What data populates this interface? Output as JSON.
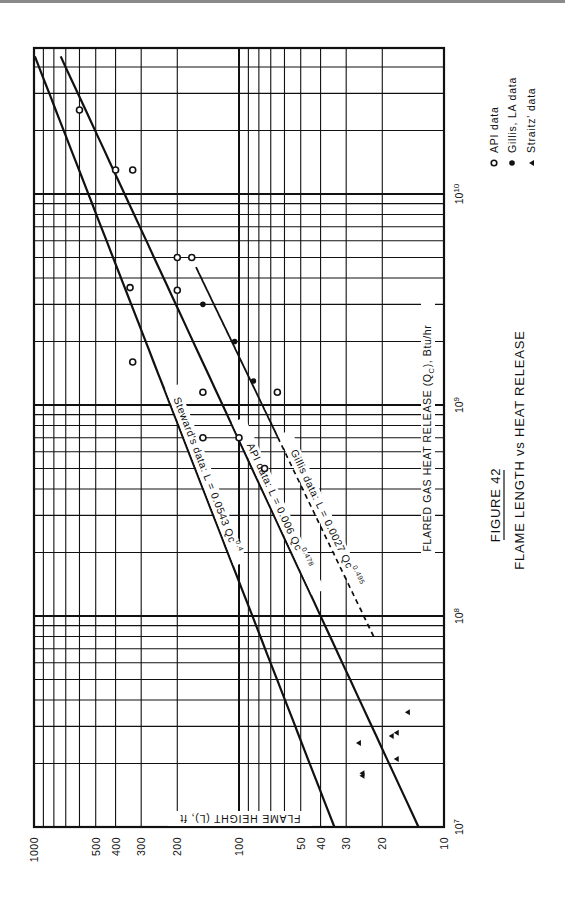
{
  "figure": {
    "number_label": "FIGURE 42",
    "title": "FLAME LENGTH vs HEAT RELEASE"
  },
  "legend": {
    "items": [
      {
        "marker": "open-circle",
        "label": "API data"
      },
      {
        "marker": "filled-circle",
        "label": "Gillis, LA data"
      },
      {
        "marker": "filled-triangle",
        "label": "Straitz' data"
      }
    ]
  },
  "annotations": {
    "steward": {
      "prefix": "Steward's data:",
      "eq": "L = 0.0543 Qc",
      "exp": "0.4"
    },
    "api": {
      "prefix": "API data:",
      "eq": "L = 0.006 Qc",
      "exp": "0.478"
    },
    "gillis": {
      "prefix": "Gillis data:",
      "eq": "L = 0.0027 Qc",
      "exp": "0.495"
    }
  },
  "chart_data": {
    "type": "scatter",
    "title": "FLAME LENGTH vs HEAT RELEASE",
    "subtitle": "FIGURE 42",
    "xlabel": "FLARED GAS HEAT RELEASE (Qc), Btu/hr",
    "ylabel": "FLAME HEIGHT (L), ft",
    "xscale": "log",
    "yscale": "log",
    "xlim": [
      10000000,
      40000000000
    ],
    "ylim": [
      10,
      1000
    ],
    "x_ticks": [
      "10^7",
      "10^8",
      "10^9",
      "10^10"
    ],
    "y_ticks": [
      "10",
      "20",
      "30",
      "40",
      "50",
      "100",
      "200",
      "300",
      "400",
      "500",
      "1000"
    ],
    "grid": true,
    "orientation": "rotated 90° clockwise (x-axis vertical, increasing upward; y-axis horizontal, increasing leftward)",
    "legend_position": "right",
    "series": [
      {
        "name": "API data",
        "marker": "open-circle",
        "points": [
          {
            "x": 25000000000,
            "y": 600
          },
          {
            "x": 13000000000,
            "y": 400
          },
          {
            "x": 13000000000,
            "y": 330
          },
          {
            "x": 5000000000,
            "y": 200
          },
          {
            "x": 5000000000,
            "y": 170
          },
          {
            "x": 3600000000,
            "y": 340
          },
          {
            "x": 3500000000,
            "y": 200
          },
          {
            "x": 1600000000,
            "y": 330
          },
          {
            "x": 1150000000,
            "y": 150
          },
          {
            "x": 1150000000,
            "y": 65
          },
          {
            "x": 700000000,
            "y": 150
          },
          {
            "x": 700000000,
            "y": 100
          },
          {
            "x": 500000000,
            "y": 75
          }
        ]
      },
      {
        "name": "Gillis, LA data",
        "marker": "filled-circle",
        "points": [
          {
            "x": 3000000000,
            "y": 150
          },
          {
            "x": 2000000000,
            "y": 105
          },
          {
            "x": 1300000000,
            "y": 85
          }
        ]
      },
      {
        "name": "Straitz' data",
        "marker": "filled-triangle",
        "points": [
          {
            "x": 35000000,
            "y": 15
          },
          {
            "x": 28000000,
            "y": 17
          },
          {
            "x": 27000000,
            "y": 18
          },
          {
            "x": 25000000,
            "y": 26
          },
          {
            "x": 21000000,
            "y": 17
          },
          {
            "x": 18000000,
            "y": 25
          },
          {
            "x": 17500000,
            "y": 25
          }
        ]
      },
      {
        "name": "Steward's data fit: L = 0.0543 Qc^0.4",
        "type": "line",
        "coef": 0.0543,
        "exponent": 0.4,
        "x_range": [
          10000000,
          40000000000
        ]
      },
      {
        "name": "API data fit: L = 0.006 Qc^0.478",
        "type": "line",
        "coef": 0.006,
        "exponent": 0.478,
        "x_range": [
          10000000,
          40000000000
        ]
      },
      {
        "name": "Gillis data fit: L = 0.0027 Qc^0.495",
        "type": "line",
        "style": "solid above ~7e8, dashed below",
        "coef": 0.0027,
        "exponent": 0.495,
        "x_range": [
          80000000,
          4500000000
        ]
      }
    ]
  },
  "axes": {
    "x_label_text": "FLARED GAS HEAT RELEASE (Q",
    "x_label_sub": "C",
    "x_label_tail": "), Btu/hr",
    "y_label_text": "FLAME HEIGHT (L), ft",
    "x_tick_labels": [
      {
        "base": "10",
        "exp": "7"
      },
      {
        "base": "10",
        "exp": "8"
      },
      {
        "base": "10",
        "exp": "9"
      },
      {
        "base": "10",
        "exp": "10"
      }
    ],
    "y_tick_labels": [
      "1000",
      "500",
      "400",
      "300",
      "200",
      "100",
      "50",
      "40",
      "30",
      "20",
      "10"
    ]
  }
}
